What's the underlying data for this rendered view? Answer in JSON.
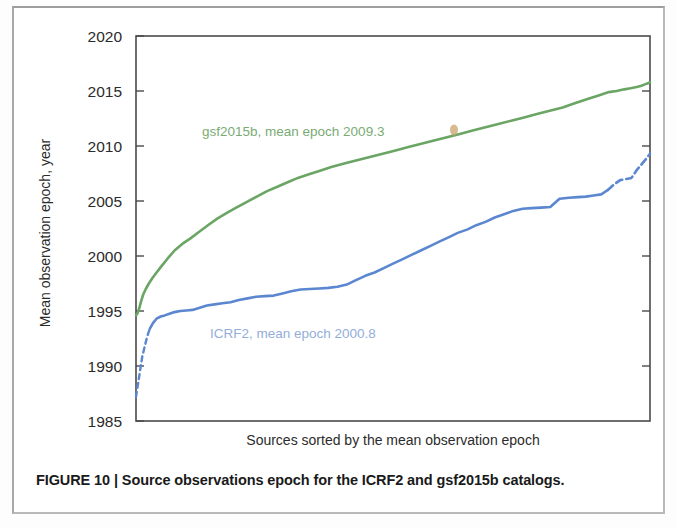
{
  "figure": {
    "caption_label": "FIGURE 10 |",
    "caption_text": " Source observations epoch for the ICRF2 and gsf2015b catalogs.",
    "caption_full": "FIGURE 10 | Source observations epoch for the ICRF2 and gsf2015b catalogs."
  },
  "chart_data": {
    "type": "line",
    "title": "",
    "xlabel": "Sources sorted by the mean observation epoch",
    "ylabel": "Mean observation epoch, year",
    "ylim": [
      1985,
      2020
    ],
    "xlim": [
      0,
      100
    ],
    "ytick_labels": [
      "2020",
      "2015",
      "2010",
      "2005",
      "2000",
      "1995",
      "1990",
      "1985"
    ],
    "yticks": [
      2020,
      2015,
      2010,
      2005,
      2000,
      1995,
      1990,
      1985
    ],
    "xtick_labels": [],
    "grid": false,
    "legend_position": "inside-annotations",
    "annotations": [
      {
        "name": "gsf2015b-annotation",
        "text": "gsf2015b, mean epoch 2009.3",
        "color": "#7aab74",
        "x": 23.5,
        "y": 2011.9
      },
      {
        "name": "icrf2-annotation",
        "text": "ICRF2, mean epoch 2000.8",
        "color": "#93adda",
        "x": 21.0,
        "y": 1992.4
      }
    ],
    "series": [
      {
        "name": "gsf2015b",
        "label": "gsf2015b, mean epoch 2009.3",
        "color": "#6aa564",
        "mean_epoch": 2009.3,
        "linestyle": "solid",
        "x": [
          0.0,
          0.3,
          0.6,
          1.0,
          1.4,
          1.9,
          2.5,
          3.2,
          4.0,
          5.0,
          6.2,
          7.5,
          9.0,
          10.6,
          12.3,
          14.0,
          15.8,
          17.6,
          19.5,
          21.5,
          23.5,
          25.5,
          27.5,
          29.5,
          31.5,
          33.5,
          35.5,
          38.0,
          40.5,
          43.0,
          45.5,
          48.0,
          50.5,
          53.0,
          55.5,
          58.0,
          60.5,
          63.0,
          65.5,
          68.0,
          70.5,
          73.0,
          75.5,
          78.0,
          80.5,
          83.0,
          85.5,
          88.0,
          90.0,
          92.0,
          93.5,
          95.0,
          96.2,
          97.2,
          98.2,
          99.0,
          99.6,
          100.0
        ],
        "y": [
          1994.6,
          1994.8,
          1995.2,
          1995.9,
          1996.5,
          1997.0,
          1997.5,
          1998.0,
          1998.5,
          1999.1,
          1999.8,
          2000.5,
          2001.1,
          2001.6,
          2002.2,
          2002.8,
          2003.4,
          2003.9,
          2004.4,
          2004.9,
          2005.4,
          2005.9,
          2006.3,
          2006.7,
          2007.1,
          2007.4,
          2007.7,
          2008.1,
          2008.4,
          2008.7,
          2009.0,
          2009.3,
          2009.6,
          2009.9,
          2010.2,
          2010.5,
          2010.8,
          2011.1,
          2011.4,
          2011.7,
          2012.0,
          2012.3,
          2012.6,
          2012.9,
          2013.2,
          2013.5,
          2013.9,
          2014.3,
          2014.6,
          2014.9,
          2015.0,
          2015.15,
          2015.25,
          2015.35,
          2015.45,
          2015.6,
          2015.7,
          2015.8
        ]
      },
      {
        "name": "ICRF2",
        "label": "ICRF2, mean epoch 2000.8",
        "color": "#5b86d0",
        "mean_epoch": 2000.8,
        "linestyle": "solid-with-dashed-tails",
        "dashed_head_x": [
          0.0,
          0.4,
          0.8,
          1.2,
          1.7,
          2.2,
          2.7
        ],
        "dashed_head_y": [
          1987.2,
          1988.4,
          1989.6,
          1990.8,
          1991.8,
          1992.7,
          1993.4
        ],
        "x": [
          2.7,
          3.3,
          4.0,
          4.8,
          5.6,
          6.5,
          7.5,
          8.6,
          9.8,
          11.0,
          12.4,
          13.8,
          15.3,
          16.8,
          18.4,
          20.0,
          21.7,
          23.4,
          25.1,
          26.8,
          28.5,
          30.2,
          32.0,
          33.8,
          35.6,
          37.4,
          39.2,
          41.0,
          42.8,
          44.6,
          46.4,
          48.2,
          50.0,
          51.8,
          53.6,
          55.4,
          57.2,
          59.0,
          60.8,
          62.6,
          64.4,
          66.2,
          68.0,
          69.8,
          71.6,
          73.4,
          75.2,
          77.0,
          78.8,
          80.6,
          82.4,
          84.2,
          86.0,
          87.5,
          89.0,
          90.5,
          91.8
        ],
        "y": [
          1993.4,
          1993.9,
          1994.3,
          1994.5,
          1994.6,
          1994.75,
          1994.9,
          1995.0,
          1995.05,
          1995.1,
          1995.3,
          1995.5,
          1995.6,
          1995.7,
          1995.8,
          1996.0,
          1996.15,
          1996.3,
          1996.35,
          1996.4,
          1996.6,
          1996.8,
          1996.95,
          1997.0,
          1997.05,
          1997.1,
          1997.2,
          1997.4,
          1997.8,
          1998.2,
          1998.5,
          1998.9,
          1999.3,
          1999.7,
          2000.1,
          2000.5,
          2000.9,
          2001.3,
          2001.7,
          2002.1,
          2002.4,
          2002.8,
          2003.1,
          2003.5,
          2003.8,
          2004.1,
          2004.3,
          2004.35,
          2004.4,
          2004.45,
          2005.2,
          2005.3,
          2005.35,
          2005.4,
          2005.5,
          2005.6,
          2006.0
        ],
        "dashed_tail_x": [
          91.8,
          93.0,
          94.2,
          95.4,
          96.4,
          97.4,
          98.3,
          99.2,
          100.0
        ],
        "dashed_tail_y": [
          2006.0,
          2006.5,
          2006.9,
          2007.0,
          2007.1,
          2007.8,
          2008.3,
          2008.8,
          2009.3
        ]
      }
    ]
  }
}
